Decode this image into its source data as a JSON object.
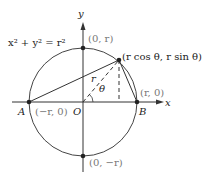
{
  "diagram": {
    "equation": "x² + y² = r²",
    "axis_x_label": "x",
    "axis_y_label": "y",
    "points": {
      "A": {
        "name": "A",
        "coord": "(−r, 0)"
      },
      "B": {
        "name": "B",
        "coord": "(r, 0)"
      },
      "C": {
        "name": "C",
        "coord": "(r cos θ, r sin θ)"
      },
      "O": {
        "name": "O"
      },
      "top": {
        "coord": "(0, r)"
      },
      "bottom": {
        "coord": "(0, −r)"
      }
    },
    "radius_label": "r",
    "angle_label": "θ",
    "colors": {
      "stroke": "#333333",
      "label": "#222222",
      "coord_label": "#777777"
    }
  }
}
